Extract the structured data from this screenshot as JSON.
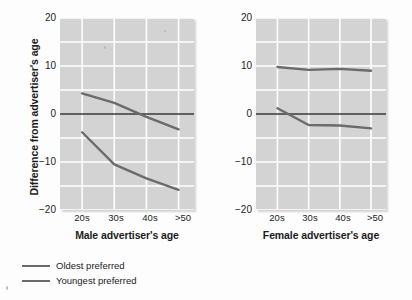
{
  "chart_data": {
    "type": "line",
    "title": "",
    "ylabel": "Difference from advertiser's age",
    "ylim": [
      -20,
      20
    ],
    "yticks": [
      20,
      10,
      0,
      -10,
      -20
    ],
    "ytick_labels": [
      "20",
      "10",
      "0",
      "−10",
      "−20"
    ],
    "grid": true,
    "grid_minor_step": 5,
    "legend_position": "below-left",
    "categories": [
      "20s",
      "30s",
      "40s",
      ">50"
    ],
    "panels": [
      {
        "xlabel": "Male advertiser's age",
        "series": [
          {
            "name": "Oldest preferred",
            "values": [
              4.3,
              2.3,
              -0.6,
              -3.2
            ]
          },
          {
            "name": "Youngest preferred",
            "values": [
              -3.8,
              -10.5,
              -13.4,
              -15.8
            ]
          }
        ]
      },
      {
        "xlabel": "Female advertiser's age",
        "series": [
          {
            "name": "Oldest preferred",
            "values": [
              9.8,
              9.2,
              9.4,
              9.0
            ]
          },
          {
            "name": "Youngest preferred",
            "values": [
              1.2,
              -2.3,
              -2.4,
              -3.0
            ]
          }
        ]
      }
    ],
    "legend": [
      {
        "label": "Oldest preferred",
        "color": "#6b6b6b"
      },
      {
        "label": "Youngest preferred",
        "color": "#6b6b6b"
      }
    ],
    "colors": {
      "series_line": "#6b6b6b",
      "plot_background": "#d3d3d3",
      "gridline": "#ffffff",
      "zero_line": "#3a3a3a",
      "text": "#1c1c1c"
    }
  }
}
